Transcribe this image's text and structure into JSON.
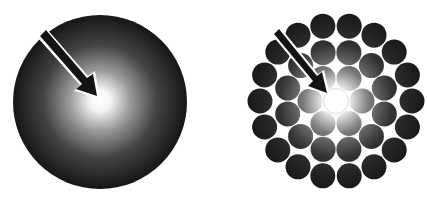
{
  "figures": [
    {
      "name": "continuous-gradient-disc",
      "center": [
        100,
        102
      ],
      "radius": 87,
      "inner_color": "#ffffff",
      "outer_color": "#111111"
    },
    {
      "name": "discrete-circle-cluster",
      "center": [
        336,
        101
      ],
      "circle_radius": 12.5
    }
  ],
  "colors": {
    "background": "#ffffff",
    "dark": "#141414",
    "light": "#ffffff"
  }
}
